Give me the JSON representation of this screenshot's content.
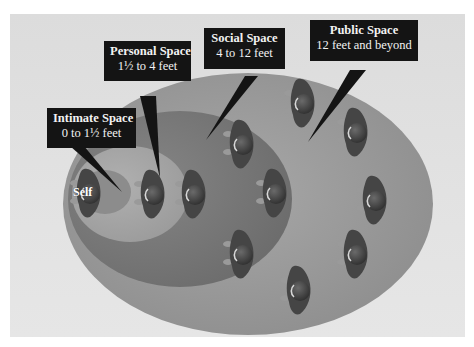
{
  "diagram": {
    "self_label": "Self",
    "zones": [
      {
        "id": "intimate",
        "name": "Intimate Space",
        "range": "0 to 1½ feet",
        "color": "#8e8e8e"
      },
      {
        "id": "personal",
        "name": "Personal Space",
        "range": "1½ to 4 feet",
        "color": "#a4a4a4"
      },
      {
        "id": "social",
        "name": "Social Space",
        "range": "4 to 12 feet",
        "color": "#7a7a7a"
      },
      {
        "id": "public",
        "name": "Public Space",
        "range": "12 feet and beyond",
        "color": "#9a9a9a"
      }
    ],
    "figure_count": 12,
    "colors": {
      "background": "#e0e0e0",
      "callout_bg": "#141414",
      "callout_text": "#f2f2f2",
      "figure": "#4a4a4a"
    }
  }
}
